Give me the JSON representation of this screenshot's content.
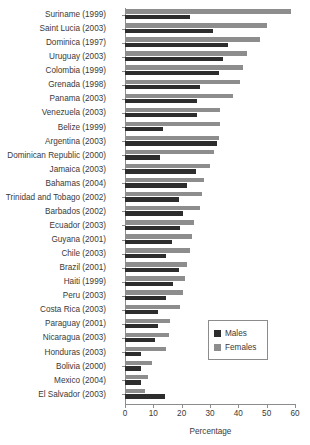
{
  "chart_data": {
    "type": "bar",
    "orientation": "horizontal",
    "title": "",
    "xlabel": "Percentage",
    "ylabel": "",
    "xlim": [
      0,
      60
    ],
    "xticks": [
      0,
      10,
      20,
      30,
      40,
      50,
      60
    ],
    "grid": false,
    "legend_position": "center-right",
    "colors": {
      "males": "#2d2d2d",
      "females": "#8d8d8d",
      "axis": "#8c8c8c",
      "text": "#3a3a3a"
    },
    "series": [
      {
        "name": "Males",
        "color": "#2d2d2d",
        "values": [
          23.0,
          31.0,
          36.5,
          34.5,
          33.0,
          26.5,
          25.5,
          25.5,
          13.5,
          32.5,
          12.5,
          25.0,
          22.0,
          19.0,
          20.5,
          19.5,
          16.5,
          14.5,
          19.0,
          17.0,
          14.5,
          11.5,
          11.5,
          10.5,
          5.5,
          5.5,
          5.5,
          14.0
        ]
      },
      {
        "name": "Females",
        "color": "#8d8d8d",
        "values": [
          58.5,
          50.0,
          47.5,
          43.0,
          41.5,
          40.5,
          38.0,
          33.5,
          33.5,
          33.0,
          31.5,
          30.0,
          28.0,
          27.0,
          26.5,
          24.5,
          23.5,
          23.0,
          22.0,
          21.0,
          20.5,
          19.5,
          16.0,
          15.5,
          14.5,
          9.5,
          8.0,
          7.0
        ]
      }
    ],
    "categories": [
      "Suriname (1999)",
      "Saint Lucia (2003)",
      "Dominica (1997)",
      "Uruguay (2003)",
      "Colombia (1999)",
      "Grenada (1998)",
      "Panama (2003)",
      "Venezuela (2003)",
      "Belize (1999)",
      "Argentina (2003)",
      "Dominican Republic (2000)",
      "Jamaica (2003)",
      "Bahamas (2004)",
      "Trinidad and Tobago (2002)",
      "Barbados (2002)",
      "Ecuador (2003)",
      "Guyana (2001)",
      "Chile (2003)",
      "Brazil (2001)",
      "Haiti (1999)",
      "Peru (2003)",
      "Costa Rica (2003)",
      "Paraguay (2001)",
      "Nicaragua (2003)",
      "Honduras (2003)",
      "Bolivia (2000)",
      "Mexico (2004)",
      "El Salvador (2003)"
    ]
  },
  "legend": {
    "items": [
      {
        "label": "Males",
        "color": "#2d2d2d"
      },
      {
        "label": "Females",
        "color": "#8d8d8d"
      }
    ]
  },
  "axis": {
    "x_title": "Percentage",
    "x_tick_labels": [
      "0",
      "10",
      "20",
      "30",
      "40",
      "50",
      "60"
    ]
  }
}
